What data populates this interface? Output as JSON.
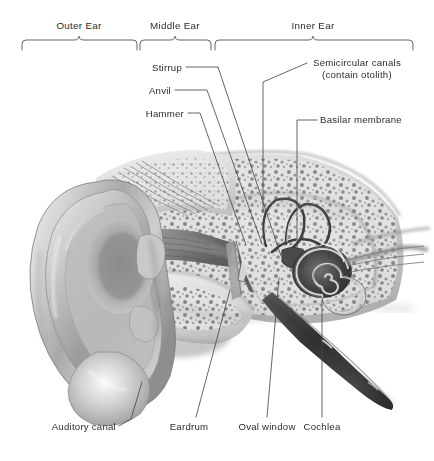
{
  "figure": {
    "type": "anatomical-illustration",
    "background_color": "#ffffff",
    "line_color": "#3a3a3a",
    "text_color": "#2b2b2b"
  },
  "sections": [
    {
      "name": "outer-ear",
      "label": "Outer Ear",
      "bracket_start_x": 22,
      "bracket_end_x": 137,
      "tick_x": 79,
      "label_x": 79,
      "label_y": 25
    },
    {
      "name": "middle-ear",
      "label": "Middle Ear",
      "bracket_start_x": 140,
      "bracket_end_x": 211,
      "tick_x": 175,
      "label_x": 175,
      "label_y": 25
    },
    {
      "name": "inner-ear",
      "label": "Inner Ear",
      "bracket_start_x": 215,
      "bracket_end_x": 413,
      "tick_x": 313,
      "label_x": 313,
      "label_y": 25
    }
  ],
  "callouts": {
    "stirrup": {
      "label": "Stirrup",
      "x": 150,
      "y": 63,
      "anchor": "right"
    },
    "anvil": {
      "label": "Anvil",
      "x": 150,
      "y": 86,
      "anchor": "right"
    },
    "hammer": {
      "label": "Hammer",
      "x": 150,
      "y": 109,
      "anchor": "right"
    },
    "semicircular_canals": {
      "label_line1": "Semicircular canals",
      "label_line2": "(contain otolith)",
      "x": 313,
      "y": 62,
      "anchor": "left"
    },
    "basilar_membrane": {
      "label": "Basilar membrane",
      "x": 320,
      "y": 120,
      "anchor": "left"
    },
    "auditory_canal": {
      "label": "Auditory canal",
      "x": 46,
      "y": 427,
      "anchor": "left"
    },
    "eardrum": {
      "label": "Eardrum",
      "x": 189,
      "y": 427,
      "anchor": "center"
    },
    "oval_window": {
      "label": "Oval window",
      "x": 266,
      "y": 427,
      "anchor": "center"
    },
    "cochlea": {
      "label": "Cochlea",
      "x": 321,
      "y": 427,
      "anchor": "center"
    }
  }
}
